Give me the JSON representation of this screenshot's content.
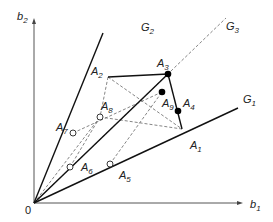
{
  "diagram": {
    "origin_label": "0",
    "axes": {
      "x": {
        "label": "b",
        "sub": "1"
      },
      "y": {
        "label": "b",
        "sub": "2"
      }
    },
    "rays": [
      {
        "id": "G1",
        "label": "G",
        "sub": "1",
        "style": "solid"
      },
      {
        "id": "G2",
        "label": "G",
        "sub": "2",
        "style": "solid"
      },
      {
        "id": "G3",
        "label": "G",
        "sub": "3",
        "style": "dashed"
      }
    ],
    "points": [
      {
        "id": "A1",
        "label": "A",
        "sub": "1",
        "marker": "none"
      },
      {
        "id": "A2",
        "label": "A",
        "sub": "2",
        "marker": "none"
      },
      {
        "id": "A3",
        "label": "A",
        "sub": "3",
        "marker": "filled"
      },
      {
        "id": "A4",
        "label": "A",
        "sub": "4",
        "marker": "filled"
      },
      {
        "id": "A5",
        "label": "A",
        "sub": "5",
        "marker": "open"
      },
      {
        "id": "A6",
        "label": "A",
        "sub": "6",
        "marker": "open"
      },
      {
        "id": "A7",
        "label": "A",
        "sub": "7",
        "marker": "open"
      },
      {
        "id": "A8",
        "label": "A",
        "sub": "8",
        "marker": "open"
      },
      {
        "id": "A9",
        "label": "A",
        "sub": "9",
        "marker": "filled"
      }
    ],
    "colors": {
      "line": "#111111",
      "dashed": "#666666",
      "axis": "#555555"
    }
  }
}
